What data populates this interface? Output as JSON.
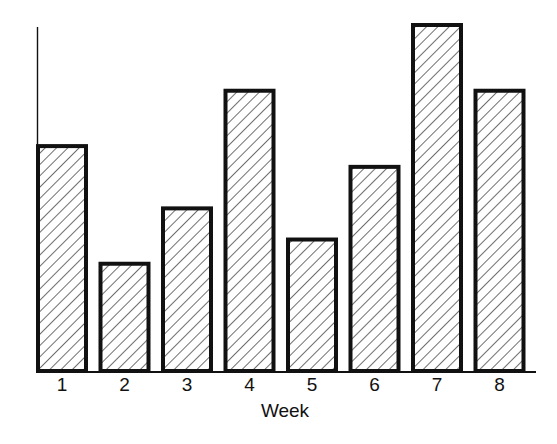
{
  "chart_data": {
    "type": "bar",
    "title": "",
    "xlabel": "Week",
    "ylabel": "",
    "categories": [
      "1",
      "2",
      "3",
      "4",
      "5",
      "6",
      "7",
      "8"
    ],
    "values": [
      6.5,
      3.1,
      4.7,
      8.1,
      3.8,
      5.9,
      10.0,
      8.1
    ],
    "ylim": [
      0,
      10
    ],
    "y_ticks_shown": false,
    "grid": false,
    "legend": null,
    "bar_style": {
      "fill": "diagonal-hatch",
      "stroke": "#111111",
      "stroke_width": 4
    }
  },
  "axis": {
    "x_title": "Week"
  }
}
